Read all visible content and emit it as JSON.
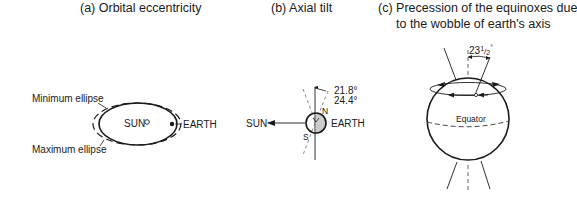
{
  "panels": {
    "a": {
      "title": "(a) Orbital eccentricity",
      "labels": {
        "min_ellipse": "Minimum ellipse",
        "max_ellipse": "Maximum ellipse",
        "sun": "SUN",
        "earth": "EARTH"
      }
    },
    "b": {
      "title": "(b)  Axial tilt",
      "labels": {
        "sun": "SUN",
        "earth": "EARTH",
        "north": "N",
        "south": "S",
        "tilt_min": "21.8°",
        "tilt_max": "24.4°"
      }
    },
    "c": {
      "title_line1": "(c)  Precession of the equinoxes due",
      "title_line2": "to the wobble of earth's axis",
      "labels": {
        "angle": "23½°",
        "angle_main": "23",
        "angle_frac": "1/2",
        "angle_deg": "°",
        "equator": "Equator"
      }
    }
  },
  "colors": {
    "line": "#1a1a1a",
    "dashed": "#555555",
    "earth_shade": "#cccccc"
  }
}
